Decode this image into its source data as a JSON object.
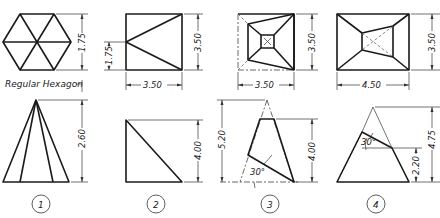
{
  "figure": {
    "type": "technical-drawing",
    "problems": [
      {
        "number": "1",
        "top_view_label": "Regular Hexagon",
        "dimensions": {
          "top_height": "1.75",
          "front_height": "2.60"
        }
      },
      {
        "number": "2",
        "dimensions": {
          "left_offset": "1.75",
          "top_height": "3.50",
          "top_width": "3.50",
          "front_height": "4.00"
        }
      },
      {
        "number": "3",
        "dimensions": {
          "top_height": "3.50",
          "top_width": "3.50",
          "apex_height": "5.20",
          "front_height": "4.00",
          "angle": "30°"
        }
      },
      {
        "number": "4",
        "dimensions": {
          "top_height": "3.50",
          "top_width": "4.50",
          "apex_height": "4.75",
          "cut_height": "2.20",
          "angle": "30°"
        }
      }
    ]
  },
  "labels": {
    "hexagon": "Regular Hexagon",
    "p1_num": "1",
    "p2_num": "2",
    "p3_num": "3",
    "p4_num": "4",
    "p1_top_h": "1.75",
    "p1_front_h": "2.60",
    "p2_offset": "1.75",
    "p2_top_h": "3.50",
    "p2_top_w": "3.50",
    "p2_front_h": "4.00",
    "p3_top_h": "3.50",
    "p3_top_w": "3.50",
    "p3_apex_h": "5.20",
    "p3_front_h": "4.00",
    "p3_angle": "30°",
    "p4_top_h": "3.50",
    "p4_top_w": "4.50",
    "p4_apex_h": "4.75",
    "p4_cut_h": "2.20",
    "p4_angle": "30°"
  }
}
